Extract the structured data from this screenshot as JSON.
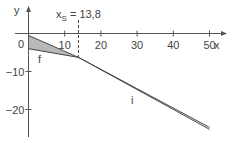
{
  "chart_data": {
    "type": "line",
    "title": "",
    "xlabel": "x",
    "ylabel": "y",
    "xlim": [
      0,
      53
    ],
    "ylim": [
      -27,
      7
    ],
    "x_ticks": [
      10,
      20,
      30,
      40,
      50
    ],
    "x_tick_labels": [
      "10",
      "20",
      "30",
      "40",
      "50"
    ],
    "y_ticks": [
      0,
      -10,
      -20
    ],
    "y_tick_labels": [
      "0",
      "−10",
      "−20"
    ],
    "grid": false,
    "legend": "none",
    "series": [
      {
        "name": "f",
        "label": "f",
        "x": [
          0,
          13.8,
          50
        ],
        "y": [
          -0.5,
          -6.3,
          -24.7
        ]
      },
      {
        "name": "i",
        "label": "i",
        "x": [
          0,
          13.8,
          50
        ],
        "y": [
          -4,
          -6.3,
          -25.2
        ]
      }
    ],
    "shaded_region": {
      "between": [
        "f",
        "i"
      ],
      "x_range": [
        0,
        13.8
      ],
      "color": "#b8b8b8"
    },
    "annotations": [
      {
        "text_main": "x",
        "text_sub": "S",
        "text_rest": " = 13,8",
        "x": 13.8,
        "style": "dashed-vertical"
      }
    ],
    "origin_label": "0"
  }
}
